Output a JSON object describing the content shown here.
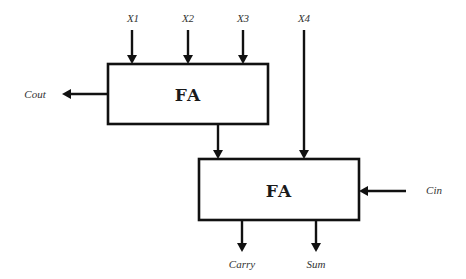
{
  "diagram": {
    "type": "block-diagram",
    "blocks": [
      {
        "id": "fa1",
        "label": "FA"
      },
      {
        "id": "fa2",
        "label": "FA"
      }
    ],
    "inputs": {
      "x1": "X1",
      "x2": "X2",
      "x3": "X3",
      "x4": "X4",
      "cin": "Cin"
    },
    "outputs": {
      "cout": "Cout",
      "carry": "Carry",
      "sum": "Sum"
    },
    "connections": [
      {
        "from": "X1",
        "to": "fa1"
      },
      {
        "from": "X2",
        "to": "fa1"
      },
      {
        "from": "X3",
        "to": "fa1"
      },
      {
        "from": "fa1",
        "to": "Cout"
      },
      {
        "from": "fa1",
        "to": "fa2"
      },
      {
        "from": "X4",
        "to": "fa2"
      },
      {
        "from": "Cin",
        "to": "fa2"
      },
      {
        "from": "fa2",
        "to": "Carry"
      },
      {
        "from": "fa2",
        "to": "Sum"
      }
    ],
    "colors": {
      "line": "#111111",
      "background": "#ffffff",
      "label": "#333333"
    }
  }
}
